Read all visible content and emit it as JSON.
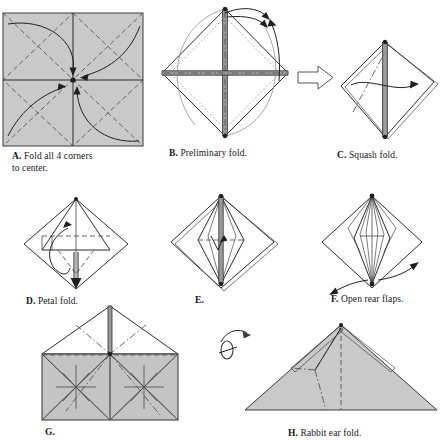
{
  "page": {
    "background": "#ffffff",
    "paper_color": "#c9c9c9",
    "ink_color": "#1f1f1f",
    "width": 442,
    "height": 441
  },
  "steps": [
    {
      "id": "A",
      "label": "A.",
      "caption_line1": "Fold all 4 corners",
      "caption_line2": "to center.",
      "caption_full": "A. Fold all 4 corners to center.",
      "shape": "square",
      "arrows": 4,
      "fold_type": "valley"
    },
    {
      "id": "B",
      "label": "B.",
      "caption_line1": "Preliminary fold.",
      "caption_line2": "",
      "caption_full": "B. Preliminary fold.",
      "shape": "diamond",
      "arrows": 2,
      "fold_type": "mountain"
    },
    {
      "id": "C",
      "label": "C.",
      "caption_line1": "Squash fold.",
      "caption_line2": "",
      "caption_full": "C. Squash fold.",
      "shape": "diamond",
      "arrows": 1,
      "fold_type": "mountain"
    },
    {
      "id": "D",
      "label": "D.",
      "caption_line1": "Petal fold.",
      "caption_line2": "",
      "caption_full": "D. Petal fold.",
      "shape": "diamond",
      "arrows": 2,
      "fold_type": "valley"
    },
    {
      "id": "E",
      "label": "E.",
      "caption_line1": "",
      "caption_line2": "",
      "caption_full": "E.",
      "shape": "diamond",
      "arrows": 1,
      "fold_type": "valley"
    },
    {
      "id": "F",
      "label": "F.",
      "caption_line1": "Open rear flaps.",
      "caption_line2": "",
      "caption_full": "F. Open rear flaps.",
      "shape": "diamond",
      "arrows": 2,
      "fold_type": "crease"
    },
    {
      "id": "G",
      "label": "G.",
      "caption_line1": "",
      "caption_line2": "",
      "caption_full": "G.",
      "shape": "house",
      "arrows": 0,
      "fold_type": "mountain"
    },
    {
      "id": "H",
      "label": "H.",
      "caption_line1": "Rabbit ear fold.",
      "caption_line2": "",
      "caption_full": "H. Rabbit ear fold.",
      "shape": "triangle",
      "arrows": 0,
      "fold_type": "mountain",
      "symbol": "turn-over"
    }
  ],
  "legend": {
    "valley_name": "valley-fold-dashed",
    "mountain_name": "mountain-fold-dashdot",
    "motion_name": "motion-arrow",
    "block_arrow_name": "process-block-arrow",
    "turnover_name": "turn-over-symbol"
  }
}
